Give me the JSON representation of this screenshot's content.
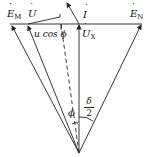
{
  "diagram": {
    "type": "phasor-diagram",
    "labels": {
      "em": {
        "main": "E",
        "sub": "M"
      },
      "u": {
        "main": "U"
      },
      "i": {
        "main": "I"
      },
      "en": {
        "main": "E",
        "sub": "N"
      },
      "ux": {
        "main": "U",
        "sub": "X"
      },
      "ucos": "u cos ϕ",
      "phi": "ϕ",
      "delta_num": "δ",
      "delta_den": "2"
    },
    "colors": {
      "line": "#222222",
      "background": "#ffffff"
    }
  }
}
